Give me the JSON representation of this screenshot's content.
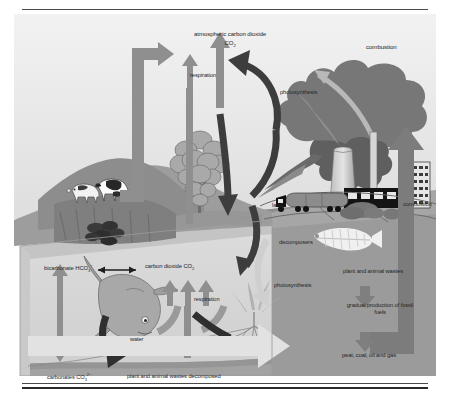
{
  "figure": {
    "type": "diagram",
    "labels": {
      "atmospheric_co2_line1": "atmospheric carbon dioxide",
      "atmospheric_co2_line2": "CO",
      "atmospheric_co2_sub": "2",
      "respiration_land": "respiration",
      "photosynthesis_land": "photosynthesis",
      "combustion_top": "combustion",
      "land": "land",
      "combustion_right": "combustion",
      "decomposers": "decomposers",
      "bicarbonate": "bicarbonate HCO",
      "bicarbonate_sub": "3",
      "bicarbonate_sup": "−",
      "carbon_dioxide_water": "carbon dioxide CO",
      "carbon_dioxide_water_sub": "2",
      "respiration_water": "respiration",
      "water": "water",
      "photosynthesis_water": "photosynthesis",
      "plant_and_animal_wastes": "plant and animal wastes",
      "gradual_production": "gradual production of fossil fuels",
      "peat_coal_oil_gas": "peat, coal, oil and gas",
      "carbonates": "carbonates CO",
      "carbonates_sub": "3",
      "carbonates_sup": "2−",
      "wastes_decomposed": "plant and animal wastes decomposed"
    },
    "colors": {
      "sky": "#ececec",
      "sky_lower": "#e2e2e2",
      "water": "#d4d4d4",
      "seabed": "#a8a8a8",
      "ground_right": "#9a9a9a",
      "hill_dark": "#8a8a8a",
      "hill_mid": "#9f9f9f",
      "smoke_dark": "#6f6f6f",
      "arrow_mid": "#8c8c8c",
      "arrow_dark": "#3c3c3c",
      "arrow_light": "#dcdcdc",
      "text": "#252525",
      "rule": "#4a4a4a"
    },
    "elements": [
      "cow",
      "cow",
      "coal-deposit",
      "tree",
      "cooling-tower",
      "smokestack",
      "factory",
      "office-building",
      "tanker-truck",
      "shrub",
      "fish",
      "seaweed-plant",
      "fish-skeleton",
      "smoke-plume"
    ]
  }
}
